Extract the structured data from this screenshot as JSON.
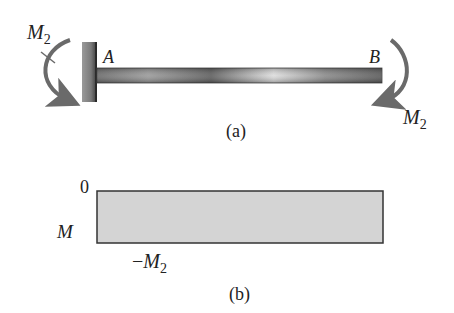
{
  "figure_a": {
    "caption": "(a)",
    "moment_left": {
      "symbol": "M",
      "subscript": "2"
    },
    "moment_right": {
      "symbol": "M",
      "subscript": "2"
    },
    "point_a": "A",
    "point_b": "B"
  },
  "figure_b": {
    "caption": "(b)",
    "axis_label": "M",
    "zero_label": "0",
    "value_label": {
      "prefix": "−",
      "symbol": "M",
      "subscript": "2"
    }
  },
  "colors": {
    "beam_dark": "#555555",
    "beam_light": "#d8d8d8",
    "wall": "#777777",
    "arrow": "#6a6a6a",
    "diagram_fill": "#d4d4d4",
    "diagram_stroke": "#333333"
  }
}
